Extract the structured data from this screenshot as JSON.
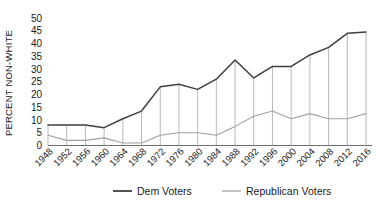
{
  "chart_data": {
    "type": "line",
    "title": "",
    "xlabel": "",
    "ylabel": "PERCENT NON-WHITE",
    "ylim": [
      0,
      50
    ],
    "yticks": [
      0,
      5,
      10,
      15,
      20,
      25,
      30,
      35,
      40,
      45,
      50
    ],
    "grid": false,
    "legend_position": "bottom",
    "categories": [
      "1948",
      "1952",
      "1956",
      "1960",
      "1964",
      "1968",
      "1972",
      "1976",
      "1980",
      "1984",
      "1988",
      "1992",
      "1996",
      "2000",
      "2004",
      "2008",
      "2012",
      "2016"
    ],
    "series": [
      {
        "name": "Dem Voters",
        "color": "#3f3f3f",
        "values": [
          8,
          8,
          8,
          7,
          10.5,
          13.5,
          23,
          24,
          22,
          26,
          33.5,
          26.5,
          31,
          31,
          35.5,
          38.5,
          44,
          44.5
        ]
      },
      {
        "name": "Republican Voters",
        "color": "#a0a0a0",
        "values": [
          4,
          2,
          2,
          3,
          1,
          1,
          4,
          5,
          5,
          4,
          7.5,
          11.5,
          13.5,
          10.5,
          12.5,
          10.5,
          10.5,
          12.5
        ]
      }
    ],
    "dropline_color": "#a8a8a8",
    "axis_color": "#6e6e6e"
  },
  "ylabel": "PERCENT NON-WHITE",
  "legend": {
    "items": [
      {
        "label": "Dem Voters",
        "color": "#3f3f3f"
      },
      {
        "label": "Republican Voters",
        "color": "#a0a0a0"
      }
    ]
  }
}
